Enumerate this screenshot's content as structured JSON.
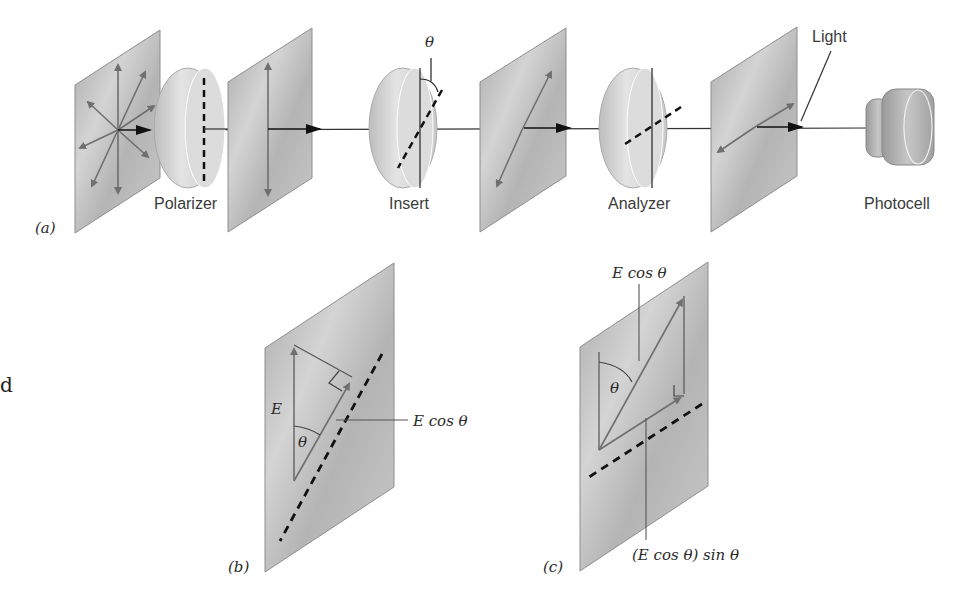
{
  "figure": {
    "panel_a": {
      "tag": "(a)",
      "labels": {
        "polarizer": "Polarizer",
        "insert": "Insert",
        "analyzer": "Analyzer",
        "photocell": "Photocell",
        "light": "Light",
        "theta": "θ"
      }
    },
    "panel_b": {
      "tag": "(b)",
      "labels": {
        "E": "E",
        "theta": "θ",
        "E_cos_theta": "E cos θ"
      }
    },
    "panel_c": {
      "tag": "(c)",
      "labels": {
        "E_cos_theta": "E cos θ",
        "theta": "θ",
        "projection": "(E cos θ) sin θ"
      }
    },
    "margin_fragment": "d"
  },
  "colors": {
    "plate_fill": "#b9b9b9",
    "plate_edge": "#8e8e8e",
    "disk_fill": "#d6d6d6",
    "arrow_gray": "#6f6f6f",
    "line_dark": "#1e1e1e"
  }
}
